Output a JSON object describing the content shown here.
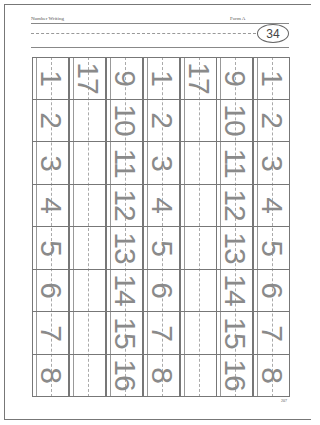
{
  "header": {
    "title": "Number Writing",
    "form": "Form A",
    "sheet_number": "34"
  },
  "columns": [
    {
      "id": "col-1",
      "cells": [
        "1",
        "2",
        "3",
        "4",
        "5",
        "6",
        "7",
        "8"
      ]
    },
    {
      "id": "col-2",
      "cells": [
        "17",
        "",
        "",
        "",
        "",
        "",
        "",
        ""
      ]
    },
    {
      "id": "col-3",
      "cells": [
        "9",
        "10",
        "11",
        "12",
        "13",
        "14",
        "15",
        "16"
      ]
    },
    {
      "id": "col-4",
      "cells": [
        "1",
        "2",
        "3",
        "4",
        "5",
        "6",
        "7",
        "8"
      ]
    },
    {
      "id": "col-5",
      "cells": [
        "17",
        "",
        "",
        "",
        "",
        "",
        "",
        ""
      ]
    },
    {
      "id": "col-6",
      "cells": [
        "9",
        "10",
        "11",
        "12",
        "13",
        "14",
        "15",
        "16"
      ]
    },
    {
      "id": "col-7",
      "cells": [
        "1",
        "2",
        "3",
        "4",
        "5",
        "6",
        "7",
        "8"
      ]
    }
  ],
  "footer": {
    "page_number": "207"
  }
}
